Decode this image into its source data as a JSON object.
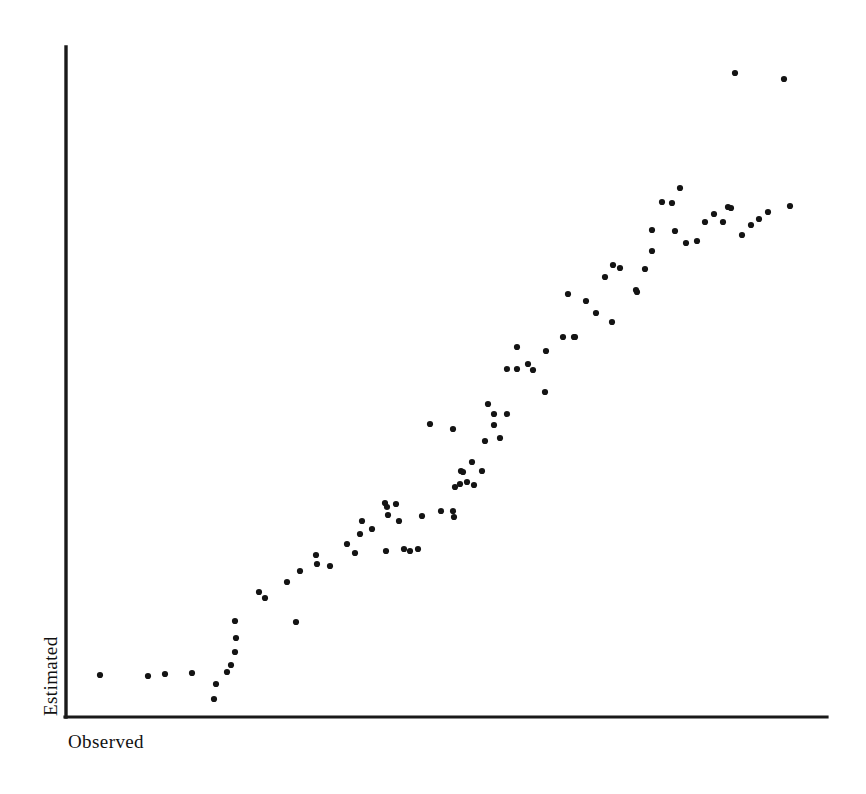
{
  "figure": {
    "background_color": "#ffffff",
    "ink_color": "#141414",
    "axis_color": "#1a1a1a"
  },
  "axes": {
    "x_label": "Observed",
    "y_label": "Estimated",
    "x_axis": {
      "x1": 66,
      "y1": 717,
      "x2": 827,
      "y2": 717
    },
    "y_axis": {
      "x1": 66,
      "y1": 47,
      "x2": 66,
      "y2": 717
    },
    "ticks_visible": false,
    "tick_labels_visible": false,
    "grid_visible": false
  },
  "chart_data": {
    "type": "scatter",
    "title": "",
    "xlabel": "Observed",
    "ylabel": "Estimated",
    "xlim": [
      0,
      100
    ],
    "ylim": [
      0,
      100
    ],
    "grid": false,
    "legend": "none",
    "marker": {
      "shape": "circle",
      "radius_px": 3.1,
      "color": "#141414"
    },
    "n_points": 92,
    "pixel_space": {
      "note": "Point positions expressed in screenshot pixel coordinates (origin top-left of the 866x794 image).",
      "points": [
        [
          100,
          675
        ],
        [
          148,
          676
        ],
        [
          165,
          674
        ],
        [
          192,
          673
        ],
        [
          216,
          684
        ],
        [
          214,
          699
        ],
        [
          227,
          672
        ],
        [
          231,
          665
        ],
        [
          235,
          652
        ],
        [
          236,
          638
        ],
        [
          235,
          621
        ],
        [
          259,
          592
        ],
        [
          265,
          598
        ],
        [
          287,
          582
        ],
        [
          296,
          622
        ],
        [
          300,
          571
        ],
        [
          316,
          555
        ],
        [
          317,
          564
        ],
        [
          330,
          566
        ],
        [
          347,
          544
        ],
        [
          355,
          553
        ],
        [
          362,
          521
        ],
        [
          360,
          534
        ],
        [
          372,
          529
        ],
        [
          385,
          503
        ],
        [
          387,
          507
        ],
        [
          396,
          504
        ],
        [
          388,
          515
        ],
        [
          399,
          521
        ],
        [
          386,
          551
        ],
        [
          404,
          549
        ],
        [
          418,
          549
        ],
        [
          422,
          516
        ],
        [
          430,
          424
        ],
        [
          441,
          511
        ],
        [
          453,
          511
        ],
        [
          454,
          517
        ],
        [
          455,
          487
        ],
        [
          460,
          484
        ],
        [
          461,
          471
        ],
        [
          453,
          429
        ],
        [
          463,
          472
        ],
        [
          467,
          482
        ],
        [
          472,
          462
        ],
        [
          474,
          485
        ],
        [
          482,
          471
        ],
        [
          485,
          441
        ],
        [
          488,
          404
        ],
        [
          494,
          414
        ],
        [
          494,
          425
        ],
        [
          507,
          414
        ],
        [
          507,
          369
        ],
        [
          517,
          347
        ],
        [
          517,
          369
        ],
        [
          528,
          364
        ],
        [
          533,
          370
        ],
        [
          546,
          351
        ],
        [
          563,
          337
        ],
        [
          568,
          294
        ],
        [
          574,
          337
        ],
        [
          575,
          337
        ],
        [
          586,
          301
        ],
        [
          596,
          313
        ],
        [
          605,
          277
        ],
        [
          613,
          265
        ],
        [
          620,
          268
        ],
        [
          636,
          290
        ],
        [
          637,
          292
        ],
        [
          645,
          269
        ],
        [
          652,
          251
        ],
        [
          652,
          230
        ],
        [
          662,
          202
        ],
        [
          672,
          203
        ],
        [
          675,
          231
        ],
        [
          680,
          188
        ],
        [
          686,
          243
        ],
        [
          697,
          241
        ],
        [
          705,
          222
        ],
        [
          714,
          214
        ],
        [
          723,
          222
        ],
        [
          728,
          207
        ],
        [
          731,
          208
        ],
        [
          735,
          73
        ],
        [
          742,
          235
        ],
        [
          751,
          225
        ],
        [
          759,
          219
        ],
        [
          768,
          212
        ],
        [
          784,
          79
        ],
        [
          790,
          206
        ],
        [
          612,
          322
        ],
        [
          545,
          392
        ],
        [
          500,
          438
        ],
        [
          410,
          551
        ]
      ]
    }
  }
}
